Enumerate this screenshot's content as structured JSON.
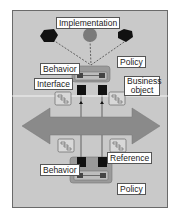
{
  "diagram": {
    "labels": {
      "implementation": "Implementation",
      "policy_top": "Policy",
      "behavior_top": "Behavior",
      "interface": "Interface",
      "business_object_line1": "Business",
      "business_object_line2": "object",
      "reference": "Reference",
      "behavior_bottom": "Behavior",
      "policy_bottom": "Policy"
    },
    "implementation_shapes": [
      "black-hexagon",
      "gray-circle",
      "black-pentagon"
    ],
    "colors": {
      "background": "#c9c9c9",
      "frame_border": "#6a6a6a",
      "arrow": "#8a8a8a",
      "behavior_box": "#9a9a9a",
      "black_shape": "#111111",
      "gray_circle": "#7a7a7a"
    }
  }
}
